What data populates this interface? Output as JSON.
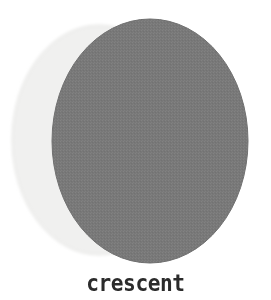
{
  "figure": {
    "label": "crescent",
    "background_color": "#ffffff",
    "caption_color": "#2b2b2b"
  },
  "moon": {
    "lit_disk": {
      "name": "moon-disk",
      "color": "#f1f1f0",
      "edge_color": "#e6e6e4",
      "center_x": 99,
      "center_y": 140,
      "radius_x": 87,
      "radius_y": 115
    },
    "shadow_disk": {
      "name": "shadow-disk",
      "color": "#787878",
      "edge_color": "#6f6f6f",
      "center_x": 150,
      "center_y": 141,
      "radius_x": 98,
      "radius_y": 122
    },
    "phase_name": "crescent",
    "illuminated_side": "left"
  }
}
